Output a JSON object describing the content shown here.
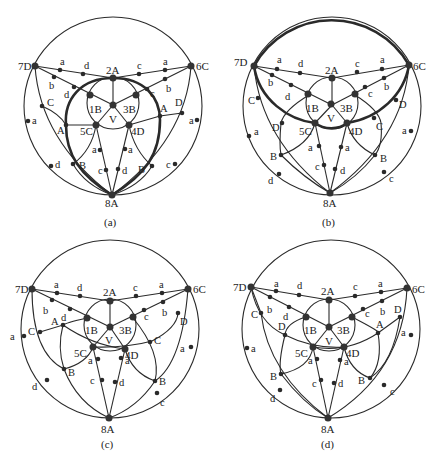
{
  "figure": {
    "panels": [
      {
        "id": "a",
        "caption": "(a)",
        "highlight": "heavy closed curve through 2A, 1B, 3B arc, A nodes, B nodes and 8A (lens-shaped cycle)",
        "nodes": {
          "n7D": "7D",
          "n6C": "6C",
          "n2A": "2A",
          "n1B": "1B",
          "n3B": "3B",
          "nV": "V",
          "n5C": "5C",
          "n4D": "4D",
          "n8A": "8A"
        },
        "edge_labels": {
          "top_left": [
            "a",
            "d"
          ],
          "top_right": [
            "c",
            "a"
          ],
          "diag_left": [
            "b",
            "d"
          ],
          "diag_right": [
            "c",
            "b"
          ],
          "left_mid": [
            "C",
            "A"
          ],
          "right_mid": [
            "A",
            "D"
          ],
          "left_outer": [
            "a",
            "d"
          ],
          "right_outer": [
            "a",
            "c"
          ],
          "lower_left": [
            "B"
          ],
          "lower_right": [
            "B"
          ],
          "center_left": [
            "a",
            "c"
          ],
          "center_right": [
            "a",
            "d"
          ]
        }
      },
      {
        "id": "b",
        "caption": "(b)",
        "highlight": "heavy top arc 7D–6C and heavy bowl arc 7D–C–D–5C–4D–C–D–6C",
        "nodes": {
          "n7D": "7D",
          "n6C": "6C",
          "n2A": "2A",
          "n1B": "1B",
          "n3B": "3B",
          "nV": "V",
          "n5C": "5C",
          "n4D": "4D",
          "n8A": "8A"
        },
        "edge_labels": {
          "top_left": [
            "a",
            "d"
          ],
          "top_right": [
            "c",
            "a"
          ],
          "diag_left": [
            "b",
            "d"
          ],
          "diag_right": [
            "c",
            "b"
          ],
          "left_mid": [
            "C",
            "D"
          ],
          "right_mid": [
            "C",
            "D"
          ],
          "left_outer": [
            "a",
            "d"
          ],
          "right_outer": [
            "a",
            "c"
          ],
          "lower_left": [
            "B"
          ],
          "lower_right": [
            "B"
          ],
          "center_left": [
            "a",
            "c"
          ],
          "center_right": [
            "a",
            "d"
          ]
        }
      },
      {
        "id": "c",
        "caption": "(c)",
        "highlight": "none",
        "nodes": {
          "n7D": "7D",
          "n6C": "6C",
          "n2A": "2A",
          "n1B": "1B",
          "n3B": "3B",
          "nV": "V",
          "n5C": "5C",
          "n4D": "4D",
          "n8A": "8A"
        },
        "edge_labels": {
          "top_left": [
            "a",
            "d"
          ],
          "top_right": [
            "c",
            "a"
          ],
          "diag_left": [
            "b",
            "d"
          ],
          "diag_right": [
            "c",
            "b"
          ],
          "left_mid": [
            "C",
            "A"
          ],
          "right_mid": [
            "C",
            "D"
          ],
          "left_outer": [
            "a",
            "d"
          ],
          "right_outer": [
            "a",
            "c"
          ],
          "lower_left": [
            "B"
          ],
          "lower_right": [
            "B"
          ],
          "center_left": [
            "a",
            "c"
          ],
          "center_right": [
            "a",
            "d"
          ]
        }
      },
      {
        "id": "d",
        "caption": "(d)",
        "highlight": "none",
        "nodes": {
          "n7D": "7D",
          "n6C": "6C",
          "n2A": "2A",
          "n1B": "1B",
          "n3B": "3B",
          "nV": "V",
          "n5C": "5C",
          "n4D": "4D",
          "n8A": "8A"
        },
        "edge_labels": {
          "top_left": [
            "a",
            "d"
          ],
          "top_right": [
            "c",
            "a"
          ],
          "diag_left": [
            "b",
            "d"
          ],
          "diag_right": [
            "c",
            "b"
          ],
          "left_mid": [
            "C",
            "D"
          ],
          "right_mid": [
            "A",
            "D"
          ],
          "left_outer": [
            "a",
            "d"
          ],
          "right_outer": [
            "a",
            "c"
          ],
          "lower_left": [
            "B"
          ],
          "lower_right": [
            "B"
          ],
          "center_left": [
            "a",
            "c"
          ],
          "center_right": [
            "a",
            "d"
          ]
        }
      }
    ]
  }
}
